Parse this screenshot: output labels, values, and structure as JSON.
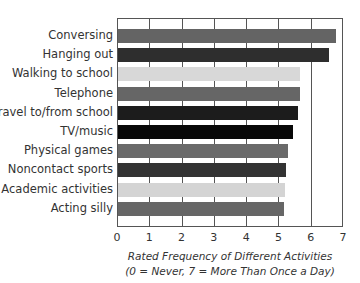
{
  "chart_data": {
    "type": "bar",
    "orientation": "horizontal",
    "title": "",
    "xlabel": "Rated Frequency of Different Activities",
    "xlabel_note": "(0 = Never,  7 = More Than Once a Day)",
    "ylabel": "",
    "xlim": [
      0,
      7
    ],
    "xticks": [
      "0",
      "1",
      "2",
      "3",
      "4",
      "5",
      "6",
      "7"
    ],
    "grid": true,
    "legend": null,
    "categories": [
      "Conversing",
      "Hanging out",
      "Walking to school",
      "Telephone",
      "Travel to/from school",
      "TV/music",
      "Physical games",
      "Noncontact sports",
      "Academic activities",
      "Acting silly"
    ],
    "values": [
      6.75,
      6.55,
      5.65,
      5.63,
      5.58,
      5.42,
      5.27,
      5.2,
      5.18,
      5.15
    ],
    "bar_colors": [
      "#646464",
      "#2e2e2e",
      "#d8d8d8",
      "#666666",
      "#1c1c1c",
      "#080808",
      "#6a6a6a",
      "#333333",
      "#d4d4d4",
      "#666666"
    ]
  }
}
